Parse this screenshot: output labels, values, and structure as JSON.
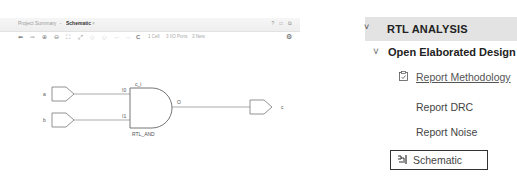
{
  "schematic_window": {
    "tabs": [
      {
        "label": "Project Summary",
        "active": false
      },
      {
        "label": "Schematic",
        "active": true,
        "close": "×"
      }
    ],
    "window_controls": "? □ ⧉",
    "toolbar": {
      "buttons": [
        {
          "name": "back-icon",
          "glyph": "⬅"
        },
        {
          "name": "forward-icon",
          "glyph": "➡"
        },
        {
          "name": "zoom-in-icon",
          "glyph": "⊕"
        },
        {
          "name": "zoom-out-icon",
          "glyph": "⊖"
        },
        {
          "name": "zoom-fit-icon",
          "glyph": "⛶"
        },
        {
          "name": "zoom-area-icon",
          "glyph": "⤢"
        },
        {
          "name": "select-prev-icon",
          "glyph": "◇"
        },
        {
          "name": "select-next-icon",
          "glyph": "◇"
        },
        {
          "name": "undo-icon",
          "glyph": "←"
        },
        {
          "name": "redo-icon",
          "glyph": "→"
        },
        {
          "name": "refresh-icon",
          "glyph": "C"
        }
      ],
      "stats": {
        "cells": "1 Cell",
        "ports": "3 I/O Ports",
        "nets": "3 Nets"
      },
      "gear": "⚙"
    },
    "schematic": {
      "inputs": [
        {
          "name": "a"
        },
        {
          "name": "b"
        }
      ],
      "cell": {
        "instance": "c_i",
        "type": "RTL_AND",
        "pins_in": [
          "I0",
          "I1"
        ],
        "pin_out": "O"
      },
      "output": {
        "name": "c"
      }
    }
  },
  "flow_navigator": {
    "section": {
      "chevron": "˅",
      "title": "RTL ANALYSIS"
    },
    "subsection": {
      "chevron": "˅",
      "title": "Open Elaborated Design"
    },
    "items": [
      {
        "label": "Report Methodology",
        "icon": "📋",
        "underlined": true
      },
      {
        "label": "Report DRC"
      },
      {
        "label": "Report Noise"
      },
      {
        "label": "Schematic",
        "icon": "⊣",
        "highlighted": true
      }
    ]
  }
}
